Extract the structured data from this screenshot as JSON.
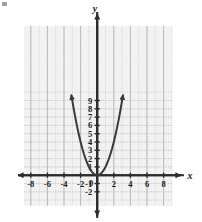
{
  "figure": {
    "title": "",
    "background_color": "#ffffff",
    "plot_background_color": "#f2f2f2",
    "grid_color": "#b9b9b9",
    "axis_color": "#2b2b2b",
    "curve_color": "#3a3a3a",
    "axis_labels": {
      "x": "x",
      "y": "y"
    },
    "origin_label": "0"
  },
  "chart_data": {
    "type": "line",
    "title": "",
    "xlabel": "x",
    "ylabel": "y",
    "function": "y = x^2",
    "grid": true,
    "legend": "none",
    "xlim": [
      -9,
      9
    ],
    "ylim": [
      -2.4,
      9.6
    ],
    "xticks": [
      -8,
      -6,
      -4,
      -2,
      0,
      2,
      4,
      6,
      8
    ],
    "xticklabels": [
      "-8",
      "-6",
      "-4",
      "-2",
      "0",
      "2",
      "4",
      "6",
      "8"
    ],
    "yticks": [
      -2,
      -1,
      1,
      2,
      3,
      4,
      5,
      6,
      7,
      8,
      9
    ],
    "yticklabels": [
      "-2",
      "-1",
      "1",
      "2",
      "3",
      "4",
      "5",
      "6",
      "7",
      "8",
      "9"
    ],
    "x": [
      -3.0,
      -2.8,
      -2.6,
      -2.4,
      -2.2,
      -2.0,
      -1.8,
      -1.6,
      -1.4,
      -1.2,
      -1.0,
      -0.8,
      -0.6,
      -0.4,
      -0.2,
      0.0,
      0.2,
      0.4,
      0.6,
      0.8,
      1.0,
      1.2,
      1.4,
      1.6,
      1.8,
      2.0,
      2.2,
      2.4,
      2.6,
      2.8,
      3.0
    ],
    "y": [
      9.0,
      7.84,
      6.76,
      5.76,
      4.84,
      4.0,
      3.24,
      2.56,
      1.96,
      1.44,
      1.0,
      0.64,
      0.36,
      0.16,
      0.04,
      0.0,
      0.04,
      0.16,
      0.36,
      0.64,
      1.0,
      1.44,
      1.96,
      2.56,
      3.24,
      4.0,
      4.84,
      5.76,
      6.76,
      7.84,
      9.0
    ],
    "arrowheads": [
      "left-branch-up",
      "right-branch-up"
    ],
    "vertex": [
      0,
      0
    ]
  }
}
